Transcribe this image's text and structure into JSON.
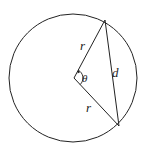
{
  "diagram": {
    "labels": {
      "radius_top": "r",
      "radius_bottom": "r",
      "angle": "θ",
      "chord": "d"
    },
    "colors": {
      "stroke": "#222222",
      "background": "#ffffff"
    }
  }
}
